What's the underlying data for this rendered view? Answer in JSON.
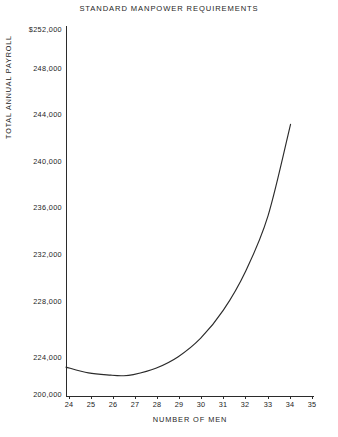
{
  "chart_data": {
    "type": "line",
    "title": "STANDARD MANPOWER REQUIREMENTS",
    "xlabel": "NUMBER OF MEN",
    "ylabel": "TOTAL ANNUAL PAYROLL",
    "grid": false,
    "legend": "none",
    "xlim": [
      24,
      35
    ],
    "ylim": [
      220000,
      252000
    ],
    "x_ticks": [
      "24",
      "25",
      "26",
      "27",
      "28",
      "29",
      "30",
      "31",
      "32",
      "33",
      "34",
      "35"
    ],
    "y_ticks": [
      "$252,000",
      "248,000",
      "244,000",
      "240,000",
      "236,000",
      "232,000",
      "228,000",
      "224,000",
      "200,000"
    ],
    "y_tick_values": [
      252000,
      248000,
      244000,
      240000,
      236000,
      232000,
      228000,
      224000,
      220000
    ],
    "series": [
      {
        "name": "Total annual payroll",
        "x": [
          24,
          25,
          26,
          26.5,
          27,
          28,
          29,
          30,
          31,
          32,
          33,
          34
        ],
        "values": [
          222500,
          222000,
          221800,
          221750,
          221850,
          222400,
          223400,
          225000,
          227400,
          230800,
          235600,
          243500
        ]
      }
    ],
    "annotations": {
      "minimum_x": 26.5,
      "minimum_y": 221750,
      "curve_start_x": 24,
      "curve_end_x": 34
    }
  },
  "axis": {
    "y_ticks": [
      {
        "label": "$252,000",
        "top": 25
      },
      {
        "label": "248,000",
        "top": 64
      },
      {
        "label": "244,000",
        "top": 110
      },
      {
        "label": "240,000",
        "top": 157
      },
      {
        "label": "236,000",
        "top": 203
      },
      {
        "label": "232,000",
        "top": 250
      },
      {
        "label": "228,000",
        "top": 297
      },
      {
        "label": "224,000",
        "top": 353
      },
      {
        "label": "200,000",
        "top": 390
      }
    ],
    "x_ticks": [
      {
        "label": "24",
        "left": 69
      },
      {
        "label": "25",
        "left": 91
      },
      {
        "label": "26",
        "left": 113
      },
      {
        "label": "27",
        "left": 135
      },
      {
        "label": "28",
        "left": 157
      },
      {
        "label": "29",
        "left": 179
      },
      {
        "label": "30",
        "left": 201
      },
      {
        "label": "31",
        "left": 223
      },
      {
        "label": "32",
        "left": 245
      },
      {
        "label": "33",
        "left": 268
      },
      {
        "label": "34",
        "left": 290
      },
      {
        "label": "35",
        "left": 312
      }
    ]
  }
}
